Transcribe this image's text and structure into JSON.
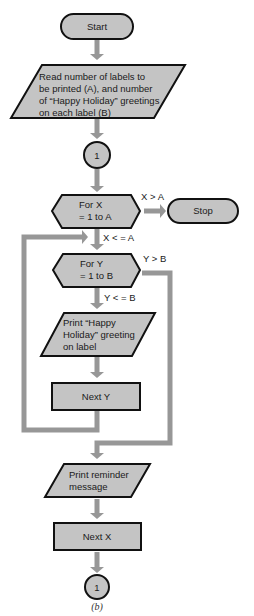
{
  "diagram": {
    "type": "flowchart",
    "caption": "(b)",
    "colors": {
      "shape_fill": "#c4c4c4",
      "shape_stroke": "#111111",
      "arrow": "#979797"
    },
    "nodes": {
      "start": {
        "shape": "terminal",
        "label": "Start"
      },
      "read_input": {
        "shape": "parallelogram",
        "lines": [
          "Read number of labels to",
          "be printed (A), and number",
          "of “Happy Holiday” greetings",
          "on each label (B)"
        ]
      },
      "connector_top": {
        "shape": "circle",
        "label": "1"
      },
      "for_x": {
        "shape": "hexagon",
        "lines": [
          "For X",
          "= 1 to A"
        ]
      },
      "stop": {
        "shape": "terminal",
        "label": "Stop"
      },
      "for_y": {
        "shape": "hexagon",
        "lines": [
          "For Y",
          "= 1 to B"
        ]
      },
      "print_greeting": {
        "shape": "parallelogram",
        "lines": [
          "Print “Happy",
          "Holiday” greeting",
          "on label"
        ]
      },
      "next_y": {
        "shape": "rectangle",
        "label": "Next Y"
      },
      "print_reminder": {
        "shape": "parallelogram",
        "lines": [
          "Print reminder",
          "message"
        ]
      },
      "next_x": {
        "shape": "rectangle",
        "label": "Next X"
      },
      "connector_bottom": {
        "shape": "circle",
        "label": "1"
      }
    },
    "edge_labels": {
      "x_gt_a": "X > A",
      "x_le_a": "X < = A",
      "y_gt_b": "Y > B",
      "y_le_b": "Y < = B"
    },
    "edges": [
      {
        "from": "start",
        "to": "read_input"
      },
      {
        "from": "read_input",
        "to": "connector_top"
      },
      {
        "from": "connector_top",
        "to": "for_x"
      },
      {
        "from": "for_x",
        "to": "stop",
        "label": "X > A"
      },
      {
        "from": "for_x",
        "to": "for_y",
        "label": "X < = A"
      },
      {
        "from": "for_y",
        "to": "print_greeting",
        "label": "Y < = B"
      },
      {
        "from": "for_y",
        "to": "print_reminder",
        "label": "Y > B"
      },
      {
        "from": "print_greeting",
        "to": "next_y"
      },
      {
        "from": "next_y",
        "to": "for_y",
        "note": "loop back"
      },
      {
        "from": "print_reminder",
        "to": "next_x"
      },
      {
        "from": "next_x",
        "to": "connector_bottom"
      }
    ]
  }
}
